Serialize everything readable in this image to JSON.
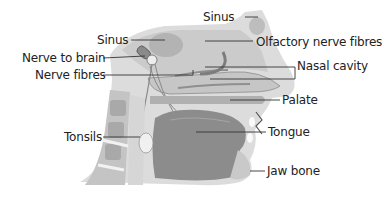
{
  "diagram": {
    "labels": [
      {
        "id": "sinus-top",
        "text": "Sinus"
      },
      {
        "id": "sinus-left",
        "text": "Sinus"
      },
      {
        "id": "nerve-to-brain",
        "text": "Nerve to brain"
      },
      {
        "id": "nerve-fibres",
        "text": "Nerve fibres"
      },
      {
        "id": "olfactory-nerve-fibres",
        "text": "Olfactory nerve fibres"
      },
      {
        "id": "nasal-cavity",
        "text": "Nasal cavity"
      },
      {
        "id": "palate",
        "text": "Palate"
      },
      {
        "id": "tonsils",
        "text": "Tonsils"
      },
      {
        "id": "tongue",
        "text": "Tongue"
      },
      {
        "id": "jaw-bone",
        "text": "Jaw bone"
      }
    ],
    "colors": {
      "skin": "#dcdcdc",
      "tissue": "#b9b9b9",
      "dark_tissue": "#7d7d7d",
      "bone": "#e9e9e9",
      "leader_line": "#333333",
      "text": "#222222"
    }
  }
}
